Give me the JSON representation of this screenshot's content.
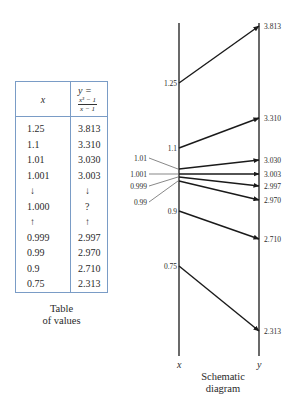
{
  "table": {
    "header_x": "x",
    "header_y_prefix": "y =",
    "header_y_numerator": "x³ − 1",
    "header_y_denominator": "x − 1",
    "rows": [
      {
        "x": "1.25",
        "y": "3.813"
      },
      {
        "x": "1.1",
        "y": "3.310"
      },
      {
        "x": "1.01",
        "y": "3.030"
      },
      {
        "x": "1.001",
        "y": "3.003"
      },
      {
        "x": "↓",
        "y": "↓"
      },
      {
        "x": "1.000",
        "y": "?"
      },
      {
        "x": "↑",
        "y": "↑"
      },
      {
        "x": "0.999",
        "y": "2.997"
      },
      {
        "x": "0.99",
        "y": "2.970"
      },
      {
        "x": "0.9",
        "y": "2.710"
      },
      {
        "x": "0.75",
        "y": "2.313"
      }
    ],
    "caption_line1": "Table",
    "caption_line2": "of values"
  },
  "diagram": {
    "x_axis_label": "x",
    "y_axis_label": "y",
    "caption_line1": "Schematic",
    "caption_line2": "diagram",
    "mappings": [
      {
        "x": "1.25",
        "y": "3.813",
        "leader": false
      },
      {
        "x": "1.1",
        "y": "3.310",
        "leader": false
      },
      {
        "x": "1.01",
        "y": "3.030",
        "leader": true
      },
      {
        "x": "1.001",
        "y": "3.003",
        "leader": true
      },
      {
        "x": "0.999",
        "y": "2.997",
        "leader": true
      },
      {
        "x": "0.99",
        "y": "2.970",
        "leader": true
      },
      {
        "x": "0.9",
        "y": "2.710",
        "leader": false
      },
      {
        "x": "0.75",
        "y": "2.313",
        "leader": false
      }
    ]
  },
  "colors": {
    "table_border": "#7a9cc6",
    "ink": "#2a2a2a"
  }
}
